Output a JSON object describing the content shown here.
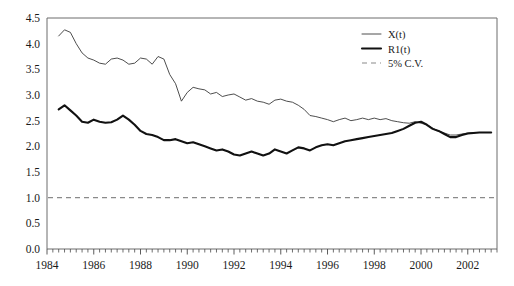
{
  "chart_data": {
    "type": "line",
    "title": "",
    "subtitle": "",
    "xlabel": "",
    "ylabel": "",
    "xlim": [
      1984.0,
      2003.25
    ],
    "ylim": [
      0.0,
      4.5
    ],
    "grid": false,
    "legend_position": "top-right",
    "yticks": [
      "0.0",
      "0.5",
      "1.0",
      "1.5",
      "2.0",
      "2.5",
      "3.0",
      "3.5",
      "4.0",
      "4.5"
    ],
    "ytick_values": [
      0.0,
      0.5,
      1.0,
      1.5,
      2.0,
      2.5,
      3.0,
      3.5,
      4.0,
      4.5
    ],
    "xticks": [
      "1984",
      "1986",
      "1988",
      "1990",
      "1992",
      "1994",
      "1996",
      "1998",
      "2000",
      "2002"
    ],
    "xtick_values": [
      1984,
      1986,
      1988,
      1990,
      1992,
      1994,
      1996,
      1998,
      2000,
      2002
    ],
    "minor_tick_interval": 0.25,
    "legend": [
      {
        "label": "X(t)",
        "style": "thin-solid",
        "color": "#3a3a3a"
      },
      {
        "label": "R1(t)",
        "style": "thick-solid",
        "color": "#111111"
      },
      {
        "label": "5% C.V.",
        "style": "dashed",
        "color": "#8a8a8a"
      }
    ],
    "series": [
      {
        "name": "X(t)",
        "style": "thin-solid",
        "color": "#3a3a3a",
        "x": [
          1984.5,
          1984.75,
          1985.0,
          1985.25,
          1985.5,
          1985.75,
          1986.0,
          1986.25,
          1986.5,
          1986.75,
          1987.0,
          1987.25,
          1987.5,
          1987.75,
          1988.0,
          1988.25,
          1988.5,
          1988.75,
          1989.0,
          1989.25,
          1989.5,
          1989.75,
          1990.0,
          1990.25,
          1990.5,
          1990.75,
          1991.0,
          1991.25,
          1991.5,
          1991.75,
          1992.0,
          1992.25,
          1992.5,
          1992.75,
          1993.0,
          1993.25,
          1993.5,
          1993.75,
          1994.0,
          1994.25,
          1994.5,
          1994.75,
          1995.0,
          1995.25,
          1995.5,
          1995.75,
          1996.0,
          1996.25,
          1996.5,
          1996.75,
          1997.0,
          1997.25,
          1997.5,
          1997.75,
          1998.0,
          1998.25,
          1998.5,
          1998.75,
          1999.0,
          1999.25,
          1999.5,
          1999.75,
          2000.0,
          2000.25,
          2000.5,
          2000.75,
          2001.0,
          2001.25,
          2001.5,
          2001.75,
          2002.0,
          2002.25,
          2002.5,
          2002.75,
          2003.0
        ],
        "y": [
          4.15,
          4.27,
          4.22,
          4.0,
          3.82,
          3.72,
          3.68,
          3.62,
          3.6,
          3.7,
          3.72,
          3.68,
          3.6,
          3.62,
          3.72,
          3.7,
          3.6,
          3.75,
          3.7,
          3.4,
          3.22,
          2.88,
          3.05,
          3.15,
          3.12,
          3.1,
          3.02,
          3.05,
          2.97,
          3.0,
          3.02,
          2.96,
          2.9,
          2.93,
          2.88,
          2.86,
          2.82,
          2.9,
          2.92,
          2.88,
          2.86,
          2.8,
          2.72,
          2.6,
          2.58,
          2.55,
          2.52,
          2.48,
          2.52,
          2.55,
          2.5,
          2.52,
          2.55,
          2.52,
          2.55,
          2.52,
          2.54,
          2.5,
          2.48,
          2.46,
          2.45,
          2.48,
          2.45,
          2.42,
          2.35,
          2.3,
          2.26,
          2.22,
          2.22,
          2.24,
          2.26,
          2.27,
          2.27,
          2.27,
          2.27
        ]
      },
      {
        "name": "R1(t)",
        "style": "thick-solid",
        "color": "#111111",
        "x": [
          1984.5,
          1984.75,
          1985.0,
          1985.25,
          1985.5,
          1985.75,
          1986.0,
          1986.25,
          1986.5,
          1986.75,
          1987.0,
          1987.25,
          1987.5,
          1987.75,
          1988.0,
          1988.25,
          1988.5,
          1988.75,
          1989.0,
          1989.25,
          1989.5,
          1989.75,
          1990.0,
          1990.25,
          1990.5,
          1990.75,
          1991.0,
          1991.25,
          1991.5,
          1991.75,
          1992.0,
          1992.25,
          1992.5,
          1992.75,
          1993.0,
          1993.25,
          1993.5,
          1993.75,
          1994.0,
          1994.25,
          1994.5,
          1994.75,
          1995.0,
          1995.25,
          1995.5,
          1995.75,
          1996.0,
          1996.25,
          1996.5,
          1996.75,
          1997.0,
          1997.25,
          1997.5,
          1997.75,
          1998.0,
          1998.25,
          1998.5,
          1998.75,
          1999.0,
          1999.25,
          1999.5,
          1999.75,
          2000.0,
          2000.25,
          2000.5,
          2000.75,
          2001.0,
          2001.25,
          2001.5,
          2001.75,
          2002.0,
          2002.25,
          2002.5,
          2002.75,
          2003.0
        ],
        "y": [
          2.72,
          2.8,
          2.7,
          2.6,
          2.48,
          2.46,
          2.52,
          2.48,
          2.46,
          2.47,
          2.52,
          2.6,
          2.52,
          2.42,
          2.3,
          2.24,
          2.22,
          2.18,
          2.12,
          2.12,
          2.14,
          2.1,
          2.06,
          2.08,
          2.04,
          2.0,
          1.96,
          1.92,
          1.94,
          1.9,
          1.84,
          1.82,
          1.86,
          1.9,
          1.86,
          1.82,
          1.86,
          1.94,
          1.9,
          1.86,
          1.92,
          1.98,
          1.96,
          1.92,
          1.98,
          2.02,
          2.04,
          2.02,
          2.06,
          2.1,
          2.12,
          2.14,
          2.16,
          2.18,
          2.2,
          2.22,
          2.24,
          2.26,
          2.3,
          2.34,
          2.4,
          2.46,
          2.48,
          2.42,
          2.34,
          2.3,
          2.24,
          2.18,
          2.18,
          2.22,
          2.25,
          2.26,
          2.27,
          2.27,
          2.27
        ]
      },
      {
        "name": "5% C.V.",
        "style": "dashed",
        "color": "#8a8a8a",
        "constant_value": 1.0
      }
    ]
  }
}
